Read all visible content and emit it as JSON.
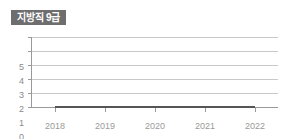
{
  "badge": {
    "label": "지방직 9급",
    "background_color": "#6e6e6e",
    "text_color": "#ffffff"
  },
  "chart_data": {
    "type": "line",
    "title": "지방직 9급",
    "xlabel": "",
    "ylabel": "",
    "x": [
      "2018",
      "2019",
      "2020",
      "2021",
      "2022"
    ],
    "categories": [
      "2018",
      "2019",
      "2020",
      "2021",
      "2022"
    ],
    "values": [
      0,
      0,
      0,
      0,
      0
    ],
    "series": [
      {
        "name": "지방직 9급",
        "values": [
          0,
          0,
          0,
          0,
          0
        ],
        "color": "#565656"
      }
    ],
    "ylim": [
      0,
      5
    ],
    "y_ticks": [
      "0",
      "1",
      "2",
      "3",
      "4",
      "5"
    ],
    "y_tick_values": [
      0,
      1,
      2,
      3,
      4,
      5
    ],
    "x_tick_labels": [
      "2018",
      "2019",
      "2020",
      "2021",
      "2022"
    ],
    "grid": true,
    "grid_color": "#c9c9c9",
    "axis_color": "#9a9a9a",
    "legend": false,
    "legend_position": "none",
    "background_color": "#ffffff",
    "tick_label_color": "#9a9a9a"
  },
  "y_axis": {
    "ticks": [
      {
        "label": "5",
        "top": 33
      },
      {
        "label": "4",
        "top": 47
      },
      {
        "label": "3",
        "top": 61
      },
      {
        "label": "2",
        "top": 75
      },
      {
        "label": "1",
        "top": 89
      },
      {
        "label": "0",
        "top": 103
      }
    ]
  },
  "x_axis": {
    "ticks": [
      {
        "label": "2018",
        "left": 33
      },
      {
        "label": "2019",
        "left": 83
      },
      {
        "label": "2020",
        "left": 133
      },
      {
        "label": "2021",
        "left": 183
      },
      {
        "label": "2022",
        "left": 233
      }
    ]
  }
}
